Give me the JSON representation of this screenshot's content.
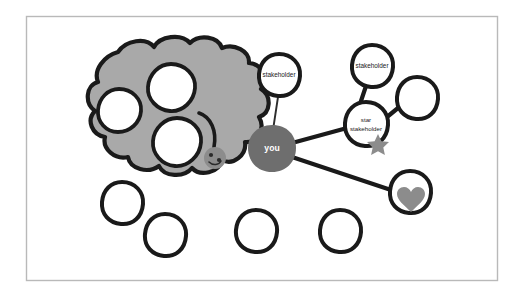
{
  "canvas": {
    "width": 524,
    "height": 300,
    "background": "#ffffff",
    "title": "stakeholder map sketch"
  },
  "frame": {
    "stroke": "#b9b9b9",
    "x": 26,
    "y": 16,
    "width": 472,
    "height": 265
  },
  "palette": {
    "ink": "#1a1a1a",
    "cloud_fill": "#a9a9a9",
    "you_fill": "#6e6e6e",
    "badge_fill": "#8c8c8c",
    "node_fill": "#ffffff",
    "label_text": "#1a1a1a",
    "you_text": "#ffffff"
  },
  "nodes": [
    {
      "id": "you",
      "label": "you",
      "type": "you-blob",
      "cx": 272,
      "cy": 148,
      "r": 23,
      "filled": true,
      "labeled": true
    },
    {
      "id": "stakeholder-top",
      "label": "stakeholder",
      "type": "circle",
      "cx": 279,
      "cy": 75,
      "r": 21,
      "filled": false,
      "labeled": true
    },
    {
      "id": "stakeholder-upper",
      "label": "stakeholder",
      "type": "circle",
      "cx": 372,
      "cy": 66,
      "r": 21,
      "filled": false,
      "labeled": true
    },
    {
      "id": "star-stakeholder",
      "label": "star stakeholder",
      "type": "circle-star",
      "cx": 366,
      "cy": 124,
      "r": 22,
      "filled": false,
      "labeled": true
    },
    {
      "id": "plain-right",
      "label": "",
      "type": "circle",
      "cx": 417,
      "cy": 98,
      "r": 21,
      "filled": false,
      "labeled": false
    },
    {
      "id": "heart-node",
      "label": "",
      "type": "circle-heart",
      "cx": 410,
      "cy": 192,
      "r": 21,
      "filled": false,
      "labeled": false
    },
    {
      "id": "plain-bottom-1",
      "label": "",
      "type": "circle",
      "cx": 122,
      "cy": 203,
      "r": 21,
      "filled": false,
      "labeled": false
    },
    {
      "id": "plain-bottom-2",
      "label": "",
      "type": "circle",
      "cx": 165,
      "cy": 235,
      "r": 21,
      "filled": false,
      "labeled": false
    },
    {
      "id": "plain-bottom-3",
      "label": "",
      "type": "circle",
      "cx": 256,
      "cy": 231,
      "r": 21,
      "filled": false,
      "labeled": false
    },
    {
      "id": "plain-bottom-4",
      "label": "",
      "type": "circle",
      "cx": 340,
      "cy": 231,
      "r": 21,
      "filled": false,
      "labeled": false
    }
  ],
  "cloud": {
    "id": "stakeholder-cloud",
    "label": "",
    "fill": "#a9a9a9",
    "holes": [
      {
        "cx": 171,
        "cy": 88,
        "r": 24
      },
      {
        "cx": 119,
        "cy": 111,
        "r": 22
      },
      {
        "cx": 176,
        "cy": 143,
        "r": 25
      }
    ],
    "badge": {
      "cx": 215,
      "cy": 158,
      "r": 11,
      "fill": "#8c8c8c"
    }
  },
  "edges": [
    {
      "id": "edge-you-stakeholder-top",
      "from": "you",
      "to": "stakeholder-top",
      "weight": "thin"
    },
    {
      "id": "edge-you-star",
      "from": "you",
      "to": "star-stakeholder",
      "weight": "thick"
    },
    {
      "id": "edge-you-heart",
      "from": "you",
      "to": "heart-node",
      "weight": "thick"
    },
    {
      "id": "edge-star-upper",
      "from": "star-stakeholder",
      "to": "stakeholder-upper",
      "weight": "thick"
    },
    {
      "id": "edge-star-plain-right",
      "from": "star-stakeholder",
      "to": "plain-right",
      "weight": "thick"
    }
  ],
  "badges": [
    {
      "id": "star-badge",
      "shape": "star",
      "on": "star-stakeholder",
      "cx": 378,
      "cy": 146,
      "size": 13,
      "fill": "#8c8c8c"
    },
    {
      "id": "heart-badge",
      "shape": "heart",
      "on": "heart-node",
      "cx": 412,
      "cy": 205,
      "size": 14,
      "fill": "#8c8c8c"
    },
    {
      "id": "cloud-badge",
      "shape": "circle",
      "on": "stakeholder-cloud",
      "cx": 215,
      "cy": 158,
      "size": 11,
      "fill": "#8c8c8c"
    }
  ]
}
